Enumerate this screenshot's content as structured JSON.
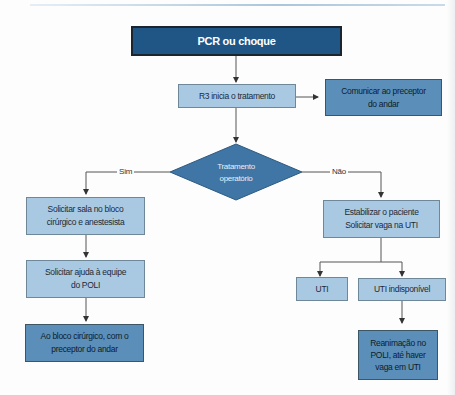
{
  "diagram": {
    "type": "flowchart",
    "nodes": {
      "start": {
        "label": "PCR ou choque",
        "color": "#1f5686"
      },
      "r3": {
        "label": "R3 inicia o tratamento",
        "color": "#a9c9e3"
      },
      "comunicar": {
        "label_line1": "Comunicar ao preceptor",
        "label_line2": "do andar",
        "color": "#5b8fba"
      },
      "decision": {
        "label_line1": "Tratamento",
        "label_line2": "operatório",
        "color": "#3f76a6"
      },
      "sala": {
        "label_line1": "Solicitar sala no bloco",
        "label_line2": "cirúrgico e anestesista",
        "color": "#a9c9e3"
      },
      "ajuda": {
        "label_line1": "Solicitar ajuda à equipe",
        "label_line2": "do POLI",
        "color": "#a9c9e3"
      },
      "bloco": {
        "label_line1": "Ao bloco cirúrgico, com o",
        "label_line2": "preceptor do andar",
        "color": "#5b8fba"
      },
      "estabilizar": {
        "label_line1": "Estabilizar o paciente",
        "label_line2": "Solicitar vaga na UTI",
        "color": "#a9c9e3"
      },
      "uti": {
        "label": "UTI",
        "color": "#a9c9e3"
      },
      "uti_indisp": {
        "label": "UTI indisponível",
        "color": "#a9c9e3"
      },
      "reanimacao": {
        "label_line1": "Reanimação no",
        "label_line2": "POLI, até haver",
        "label_line3": "vaga em UTI",
        "color": "#5b8fba"
      }
    },
    "edges": {
      "yes_label": "Sim",
      "no_label": "Não"
    }
  }
}
